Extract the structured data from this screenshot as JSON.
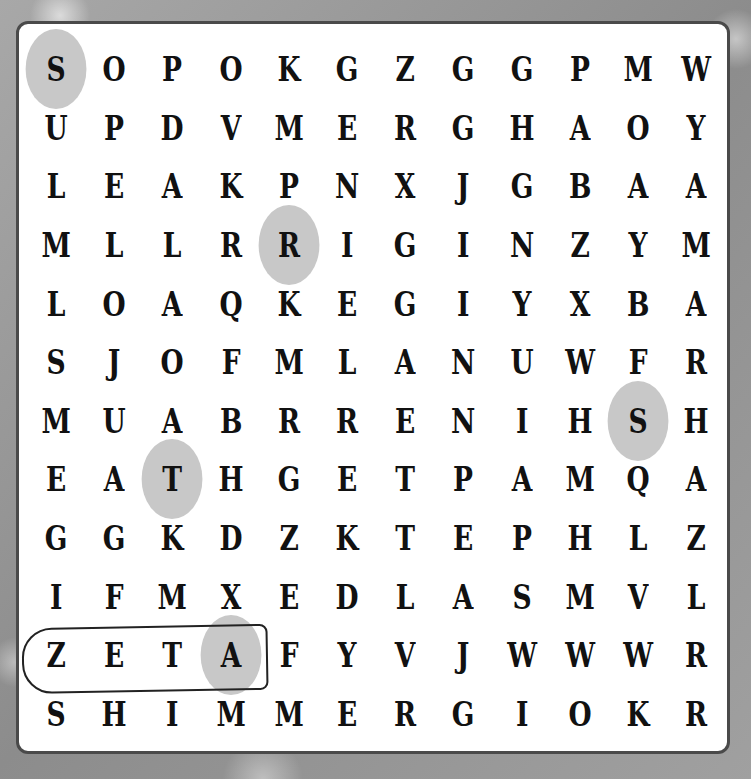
{
  "puzzle": {
    "type": "word-search",
    "rows": 12,
    "cols": 12,
    "grid": [
      [
        "S",
        "O",
        "P",
        "O",
        "K",
        "G",
        "Z",
        "G",
        "G",
        "P",
        "M",
        "W"
      ],
      [
        "U",
        "P",
        "D",
        "V",
        "M",
        "E",
        "R",
        "G",
        "H",
        "A",
        "O",
        "Y"
      ],
      [
        "L",
        "E",
        "A",
        "K",
        "P",
        "N",
        "X",
        "J",
        "G",
        "B",
        "A",
        "A"
      ],
      [
        "M",
        "L",
        "L",
        "R",
        "R",
        "I",
        "G",
        "I",
        "N",
        "Z",
        "Y",
        "M"
      ],
      [
        "L",
        "O",
        "A",
        "Q",
        "K",
        "E",
        "G",
        "I",
        "Y",
        "X",
        "B",
        "A"
      ],
      [
        "S",
        "J",
        "O",
        "F",
        "M",
        "L",
        "A",
        "N",
        "U",
        "W",
        "F",
        "R"
      ],
      [
        "M",
        "U",
        "A",
        "B",
        "R",
        "R",
        "E",
        "N",
        "I",
        "H",
        "S",
        "H"
      ],
      [
        "E",
        "A",
        "T",
        "H",
        "G",
        "E",
        "T",
        "P",
        "A",
        "M",
        "Q",
        "A"
      ],
      [
        "G",
        "G",
        "K",
        "D",
        "Z",
        "K",
        "T",
        "E",
        "P",
        "H",
        "L",
        "Z"
      ],
      [
        "I",
        "F",
        "M",
        "X",
        "E",
        "D",
        "L",
        "A",
        "S",
        "M",
        "V",
        "L"
      ],
      [
        "Z",
        "E",
        "T",
        "A",
        "F",
        "Y",
        "V",
        "J",
        "W",
        "W",
        "W",
        "R"
      ],
      [
        "S",
        "H",
        "I",
        "M",
        "M",
        "E",
        "R",
        "G",
        "I",
        "O",
        "K",
        "R"
      ]
    ],
    "highlighted_cells": [
      {
        "row": 0,
        "col": 0,
        "letter": "S"
      },
      {
        "row": 3,
        "col": 4,
        "letter": "R"
      },
      {
        "row": 6,
        "col": 10,
        "letter": "S"
      },
      {
        "row": 7,
        "col": 2,
        "letter": "T"
      },
      {
        "row": 10,
        "col": 3,
        "letter": "A"
      }
    ],
    "circled_word": {
      "word": "ZETA",
      "row": 10,
      "start_col": 0,
      "end_col": 3
    },
    "colors": {
      "highlight": "#c8c8c8",
      "board_border": "#4a4a4a",
      "letter": "#111111"
    }
  }
}
